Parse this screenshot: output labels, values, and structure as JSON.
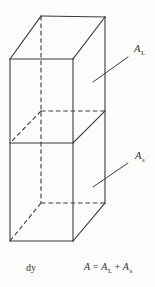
{
  "figure": {
    "background_color": "#fcfcfa",
    "line_color": "#3a3a3a",
    "text_color": "#2f2f2f",
    "labels": {
      "upper": {
        "main": "A",
        "sub": "L"
      },
      "lower": {
        "main": "A",
        "sub": "s"
      },
      "height": "dy"
    },
    "equation": {
      "lhs": "A",
      "equals": "=",
      "term1": {
        "main": "A",
        "sub": "L"
      },
      "plus": "+",
      "term2": {
        "main": "A",
        "sub": "s"
      }
    }
  }
}
